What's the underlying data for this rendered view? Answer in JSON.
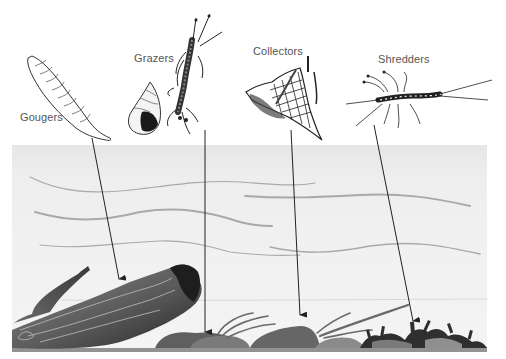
{
  "diagram": {
    "labels": {
      "gougers": "Gougers",
      "grazers": "Grazers",
      "collectors": "Collectors",
      "shredders": "Shredders"
    },
    "label_positions": {
      "gougers": {
        "x": 20,
        "y": 111
      },
      "grazers": {
        "x": 134,
        "y": 52
      },
      "collectors": {
        "x": 253,
        "y": 45
      },
      "shredders": {
        "x": 378,
        "y": 53
      }
    },
    "arrows": [
      {
        "group": "gougers",
        "from": [
          92,
          138
        ],
        "to": [
          119,
          280
        ],
        "target": "submerged log"
      },
      {
        "group": "grazers",
        "from": [
          205,
          130
        ],
        "to": [
          205,
          333
        ],
        "target": "rock surface"
      },
      {
        "group": "collectors",
        "from": [
          291,
          130
        ],
        "to": [
          300,
          316
        ],
        "target": "rock / sediment"
      },
      {
        "group": "shredders",
        "from": [
          374,
          125
        ],
        "to": [
          413,
          322
        ],
        "target": "leaf litter"
      }
    ],
    "organisms": [
      {
        "group": "gougers",
        "icon": "larva-icon"
      },
      {
        "group": "grazers",
        "icon": "snail-shell-icon"
      },
      {
        "group": "grazers",
        "icon": "caddisfly-larva-icon"
      },
      {
        "group": "collectors",
        "icon": "net-spinning-caddisfly-icon"
      },
      {
        "group": "shredders",
        "icon": "stonefly-nymph-icon"
      }
    ],
    "water": {
      "x": 12,
      "y": 145,
      "width": 475,
      "height": 203
    },
    "colors": {
      "background": "#ffffff",
      "water_top": "#ebebeb",
      "water_bottom": "#f3f3f3",
      "current_lines": "#a8a8a8",
      "arrows": "#222222",
      "label_text": "#555555",
      "log_light": "#8a8a8a",
      "log_dark": "#2e2e2e",
      "rocks": "#6e6e6e",
      "debris": "#333333"
    }
  }
}
